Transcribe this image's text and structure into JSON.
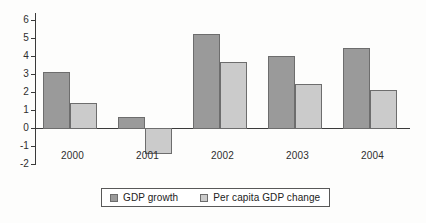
{
  "chart_data": {
    "type": "bar",
    "title": "",
    "subtitle": "",
    "xlabel": "",
    "ylabel": "",
    "categories": [
      "2000",
      "2001",
      "2002",
      "2003",
      "2004"
    ],
    "series": [
      {
        "name": "GDP growth",
        "color": "#9a9a9a",
        "values": [
          3.1,
          0.6,
          5.2,
          4.0,
          4.45
        ]
      },
      {
        "name": "Per capita GDP change",
        "color": "#cbcbcb",
        "values": [
          1.4,
          -1.4,
          3.65,
          2.45,
          2.1
        ]
      }
    ],
    "ylim": [
      -2,
      6
    ],
    "ytick_labels": [
      "6",
      "5",
      "4",
      "3",
      "2",
      "1",
      "0",
      "-1",
      "-2"
    ],
    "ytick_values": [
      6,
      5,
      4,
      3,
      2,
      1,
      0,
      -1,
      -2
    ],
    "grid": false,
    "legend_position": "bottom-center",
    "axis_color": "#3a3a3a",
    "bar_border_color": "#6d6d6d",
    "background_color": "#fdfdfc"
  }
}
